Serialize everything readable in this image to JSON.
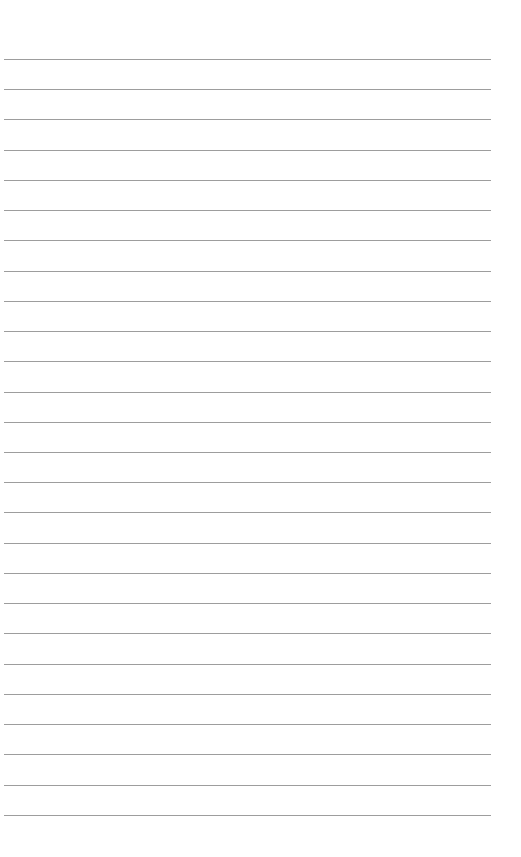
{
  "page": {
    "type": "lined-paper",
    "background_color": "#ffffff",
    "line_color": "#8c8c8c",
    "line_count": 26,
    "first_line_y": 59,
    "line_spacing": 30.23,
    "line_left": 4,
    "line_right": 491,
    "text": []
  }
}
